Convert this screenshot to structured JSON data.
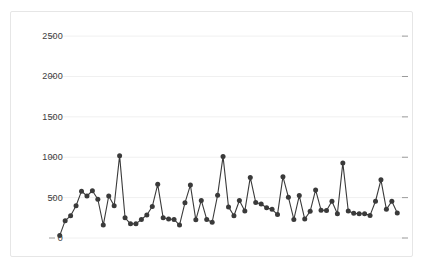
{
  "card": {
    "border_color": "#e6e6e6",
    "background": "#ffffff"
  },
  "caption": {
    "text": ""
  },
  "chart_data": {
    "type": "line",
    "title": "",
    "subtitle": "",
    "xlabel": "",
    "ylabel": "",
    "marker": "circle",
    "marker_color": "#3a3a3a",
    "line_color": "#3a3a3a",
    "grid": true,
    "grid_color": "#f0f0f0",
    "legend": "none",
    "legend_position": "none",
    "axis_tick_color": "#9a9a9a",
    "ylim": [
      0,
      2650
    ],
    "yticks": [
      0,
      500,
      1000,
      1500,
      2000,
      2500
    ],
    "ytick_labels": [
      "0",
      "500",
      "1000",
      "1500",
      "2000",
      "2500"
    ],
    "xticks": [],
    "xtick_labels": [],
    "xlim": [
      0,
      76
    ],
    "n_points": 75,
    "values": [
      30,
      215,
      275,
      400,
      580,
      520,
      585,
      480,
      160,
      520,
      400,
      1020,
      250,
      175,
      175,
      230,
      285,
      390,
      665,
      250,
      235,
      230,
      160,
      435,
      655,
      225,
      465,
      230,
      195,
      530,
      1010,
      385,
      275,
      465,
      335,
      750,
      440,
      420,
      375,
      355,
      290,
      760,
      505,
      230,
      525,
      235,
      330,
      595,
      345,
      340,
      455,
      300,
      930,
      335,
      305,
      300,
      300,
      280,
      455,
      720,
      355,
      455,
      310
    ]
  }
}
